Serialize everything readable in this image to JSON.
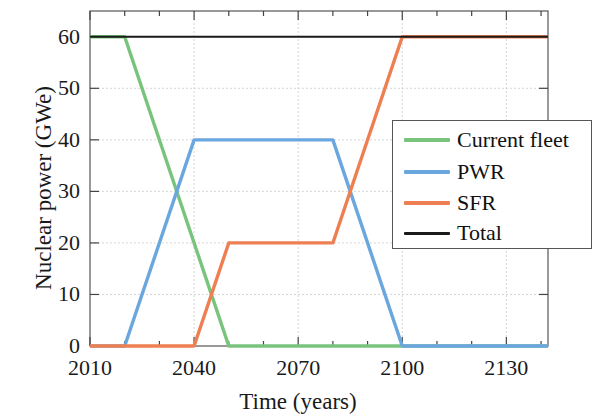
{
  "chart_data": {
    "type": "line",
    "title": "",
    "xlabel": "Time (years)",
    "ylabel": "Nuclear power (GWe)",
    "xlim": [
      2010,
      2142
    ],
    "ylim": [
      0,
      65
    ],
    "xticks": [
      2010,
      2040,
      2070,
      2100,
      2130
    ],
    "xtick_labels": [
      "2010",
      "2040",
      "2070",
      "2100",
      "2130"
    ],
    "xminor_step": 10,
    "yticks": [
      0,
      10,
      20,
      30,
      40,
      50,
      60
    ],
    "ytick_labels": [
      "0",
      "10",
      "20",
      "30",
      "40",
      "50",
      "60"
    ],
    "grid": true,
    "legend_position": "center right",
    "series": [
      {
        "name": "Current fleet",
        "color": "#79c47d",
        "x": [
          2010,
          2020,
          2050,
          2142
        ],
        "values": [
          60,
          60,
          0,
          0
        ]
      },
      {
        "name": "PWR",
        "color": "#6aa7de",
        "x": [
          2010,
          2020,
          2040,
          2080,
          2100,
          2142
        ],
        "values": [
          0,
          0,
          40,
          40,
          0,
          0
        ]
      },
      {
        "name": "SFR",
        "color": "#ee7f52",
        "x": [
          2010,
          2040,
          2050,
          2080,
          2100,
          2142
        ],
        "values": [
          0,
          0,
          20,
          20,
          60,
          60
        ]
      },
      {
        "name": "Total",
        "color": "#1a1a1a",
        "x": [
          2010,
          2142
        ],
        "values": [
          60,
          60
        ]
      }
    ]
  },
  "legend": {
    "items": [
      {
        "label": "Current fleet",
        "color": "#79c47d"
      },
      {
        "label": "PWR",
        "color": "#6aa7de"
      },
      {
        "label": "SFR",
        "color": "#ee7f52"
      },
      {
        "label": "Total",
        "color": "#1a1a1a"
      }
    ]
  }
}
